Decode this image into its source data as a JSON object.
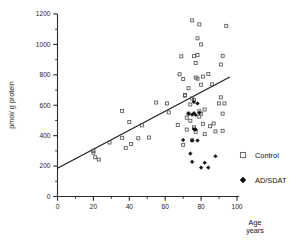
{
  "chart_data": {
    "type": "scatter",
    "title": "",
    "xlabel": "Age years",
    "xlabel_line1": "Age",
    "xlabel_line2": "years",
    "ylabel": "pmol/ g protein",
    "xlim": [
      0,
      100
    ],
    "ylim": [
      0,
      1200
    ],
    "x_ticks": [
      0,
      20,
      40,
      60,
      80,
      100
    ],
    "x_tick_labels": [
      "0",
      "20",
      "40",
      "60",
      "80",
      "100"
    ],
    "x_minor_ticks": [
      10,
      30,
      50,
      70,
      90
    ],
    "y_ticks": [
      0,
      200,
      400,
      600,
      800,
      1000,
      1200
    ],
    "y_tick_labels": [
      "0",
      "200",
      "400",
      "600",
      "800",
      "1000",
      "1200"
    ],
    "y_minor_ticks": [
      100,
      300,
      500,
      700,
      900,
      1100
    ],
    "grid": false,
    "legend_position": "right",
    "series": [
      {
        "name": "Control",
        "marker": "open-square",
        "color": "#555555",
        "points": [
          [
            20,
            300
          ],
          [
            20,
            288
          ],
          [
            21,
            258
          ],
          [
            23,
            243
          ],
          [
            29,
            355
          ],
          [
            36,
            563
          ],
          [
            36,
            386
          ],
          [
            38,
            320
          ],
          [
            40,
            490
          ],
          [
            41,
            345
          ],
          [
            45,
            383
          ],
          [
            47,
            468
          ],
          [
            51,
            388
          ],
          [
            55,
            618
          ],
          [
            61,
            612
          ],
          [
            62,
            553
          ],
          [
            67,
            470
          ],
          [
            68,
            804
          ],
          [
            69,
            922
          ],
          [
            70,
            340
          ],
          [
            70,
            773
          ],
          [
            71,
            663
          ],
          [
            71,
            668
          ],
          [
            72,
            440
          ],
          [
            72,
            518
          ],
          [
            73,
            545
          ],
          [
            73,
            712
          ],
          [
            74,
            605
          ],
          [
            74,
            498
          ],
          [
            75,
            645
          ],
          [
            75,
            1158
          ],
          [
            75,
            370
          ],
          [
            76,
            455
          ],
          [
            76,
            923
          ],
          [
            76,
            635
          ],
          [
            77,
            878
          ],
          [
            77,
            782
          ],
          [
            77,
            425
          ],
          [
            78,
            775
          ],
          [
            78,
            930
          ],
          [
            78,
            1040
          ],
          [
            79,
            1132
          ],
          [
            79,
            560
          ],
          [
            79,
            525
          ],
          [
            80,
            1000
          ],
          [
            80,
            735
          ],
          [
            80,
            545
          ],
          [
            81,
            788
          ],
          [
            81,
            478
          ],
          [
            82,
            572
          ],
          [
            82,
            410
          ],
          [
            84,
            805
          ],
          [
            85,
            462
          ],
          [
            86,
            738
          ],
          [
            87,
            480
          ],
          [
            88,
            428
          ],
          [
            90,
            612
          ],
          [
            91,
            652
          ],
          [
            91,
            868
          ],
          [
            92,
            925
          ],
          [
            92,
            545
          ],
          [
            92,
            432
          ],
          [
            93,
            612
          ],
          [
            94,
            1122
          ]
        ]
      },
      {
        "name": "AD/SDAT",
        "marker": "filled-diamond",
        "color": "#0d0d0d",
        "points": [
          [
            70,
            372
          ],
          [
            73,
            545
          ],
          [
            74,
            282
          ],
          [
            75,
            538
          ],
          [
            75,
            368
          ],
          [
            75,
            228
          ],
          [
            76,
            622
          ],
          [
            76,
            548
          ],
          [
            76,
            443
          ],
          [
            77,
            440
          ],
          [
            77,
            536
          ],
          [
            78,
            612
          ],
          [
            78,
            368
          ],
          [
            79,
            550
          ],
          [
            80,
            190
          ],
          [
            82,
            222
          ],
          [
            84,
            190
          ],
          [
            88,
            265
          ]
        ]
      }
    ],
    "regression_line": {
      "x_start": 0,
      "y_start": 185,
      "x_end": 96,
      "y_end": 785
    }
  },
  "legend": {
    "items": [
      {
        "label": "Control",
        "marker": "open-square"
      },
      {
        "label": "AD/SDAT",
        "marker": "filled-diamond"
      }
    ]
  }
}
